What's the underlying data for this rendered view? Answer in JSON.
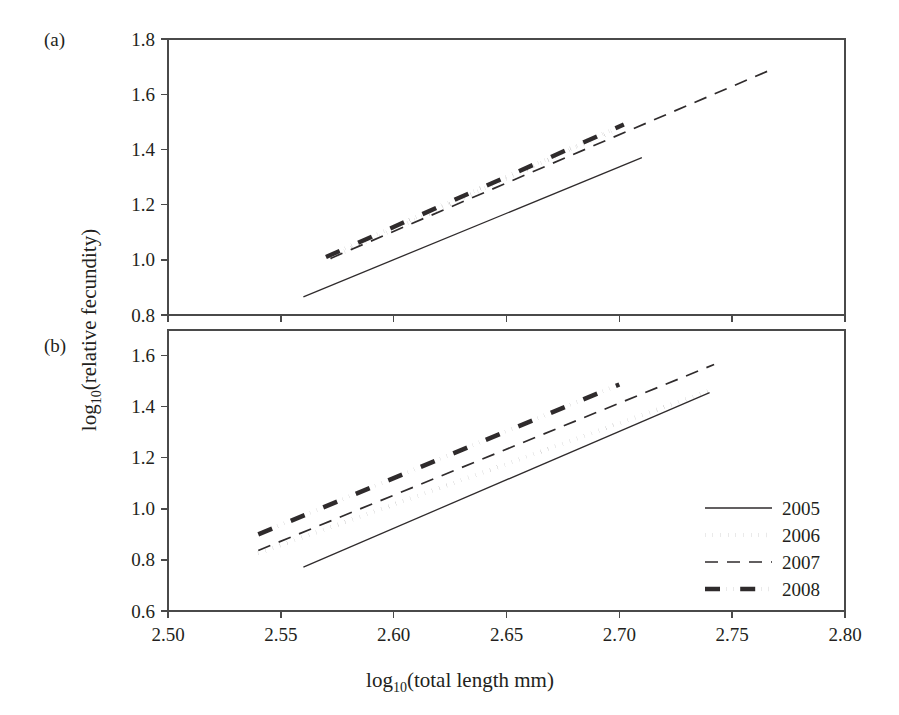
{
  "figure": {
    "panel_a_label": "(a)",
    "panel_b_label": "(b)",
    "y_axis_title_main": "log",
    "y_axis_title_sub": "10",
    "y_axis_title_rest": "(relative fecundity)",
    "x_axis_title_main": "log",
    "x_axis_title_sub": "10",
    "x_axis_title_rest": "(total length mm)"
  },
  "legend": {
    "position": "bottom-right",
    "entries": [
      {
        "label": "2005",
        "style": "solid",
        "width": 1.3
      },
      {
        "label": "2006",
        "style": "dotted",
        "width": 4.2
      },
      {
        "label": "2007",
        "style": "dashed",
        "width": 1.6
      },
      {
        "label": "2008",
        "style": "dashdotdot",
        "width": 4.2
      }
    ]
  },
  "chart_data": [
    {
      "id": "panel-a",
      "panel": "(a)",
      "type": "line",
      "title": "",
      "xlabel": "log10(total length mm)",
      "ylabel": "log10(relative fecundity)",
      "xlim": [
        2.5,
        2.8
      ],
      "ylim": [
        0.8,
        1.8
      ],
      "xticks": [
        2.5,
        2.55,
        2.6,
        2.65,
        2.7,
        2.75,
        2.8
      ],
      "xticklabels": [
        "2.50",
        "2.55",
        "2.60",
        "2.65",
        "2.70",
        "2.75",
        "2.80"
      ],
      "yticks": [
        0.8,
        1.0,
        1.2,
        1.4,
        1.6,
        1.8
      ],
      "yticklabels": [
        "0.8",
        "1.0",
        "1.2",
        "1.4",
        "1.6",
        "1.8"
      ],
      "grid": false,
      "legend": false,
      "series": [
        {
          "name": "2005",
          "style": "solid",
          "x": [
            2.56,
            2.71
          ],
          "y": [
            0.866,
            1.37
          ]
        },
        {
          "name": "2006",
          "style": "dotted",
          "x": [
            2.572,
            2.7
          ],
          "y": [
            1.007,
            1.478
          ]
        },
        {
          "name": "2007",
          "style": "dashed",
          "x": [
            2.572,
            2.767
          ],
          "y": [
            1.005,
            1.688
          ]
        },
        {
          "name": "2008",
          "style": "dashdotdot",
          "x": [
            2.57,
            2.702
          ],
          "y": [
            1.01,
            1.49
          ]
        }
      ]
    },
    {
      "id": "panel-b",
      "panel": "(b)",
      "type": "line",
      "title": "",
      "xlabel": "log10(total length mm)",
      "ylabel": "log10(relative fecundity)",
      "xlim": [
        2.5,
        2.8
      ],
      "ylim": [
        0.6,
        1.7
      ],
      "xticks": [
        2.5,
        2.55,
        2.6,
        2.65,
        2.7,
        2.75,
        2.8
      ],
      "xticklabels": [
        "2.50",
        "2.55",
        "2.60",
        "2.65",
        "2.70",
        "2.75",
        "2.80"
      ],
      "yticks": [
        0.6,
        0.8,
        1.0,
        1.2,
        1.4,
        1.6
      ],
      "yticklabels": [
        "0.6",
        "0.8",
        "1.0",
        "1.2",
        "1.4",
        "1.6"
      ],
      "grid": false,
      "legend": true,
      "series": [
        {
          "name": "2005",
          "style": "solid",
          "x": [
            2.56,
            2.74
          ],
          "y": [
            0.772,
            1.455
          ]
        },
        {
          "name": "2006",
          "style": "dotted",
          "x": [
            2.54,
            2.74
          ],
          "y": [
            0.826,
            1.462
          ]
        },
        {
          "name": "2007",
          "style": "dashed",
          "x": [
            2.54,
            2.742
          ],
          "y": [
            0.837,
            1.565
          ]
        },
        {
          "name": "2008",
          "style": "dashdotdot",
          "x": [
            2.54,
            2.7
          ],
          "y": [
            0.9,
            1.487
          ]
        }
      ]
    }
  ]
}
